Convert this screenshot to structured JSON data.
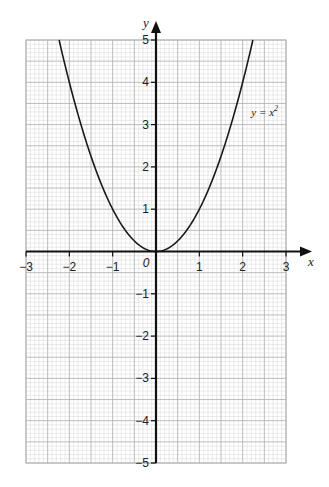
{
  "chart_data": {
    "type": "line",
    "title": "",
    "xlabel": "x",
    "ylabel": "y",
    "xlim": [
      -3,
      3
    ],
    "ylim": [
      -5,
      5
    ],
    "grid": true,
    "grid_minor_step": 0.1,
    "grid_major_step": 0.5,
    "x_ticks": [
      -3,
      -2,
      -1,
      0,
      1,
      2,
      3
    ],
    "x_tick_labels": [
      "−3",
      "−2",
      "−1",
      "0",
      "1",
      "2",
      "3"
    ],
    "y_ticks": [
      -5,
      -4,
      -3,
      -2,
      -1,
      1,
      2,
      3,
      4,
      5
    ],
    "y_tick_labels": [
      "−5",
      "−4",
      "−3",
      "−2",
      "−1",
      "1",
      "2",
      "3",
      "4",
      "5"
    ],
    "origin_label": "0",
    "series": [
      {
        "name": "y = x²",
        "equation": "y = x^2",
        "x": [
          -2.236,
          -2,
          -1.5,
          -1,
          -0.5,
          0,
          0.5,
          1,
          1.5,
          2,
          2.236
        ],
        "y": [
          5,
          4,
          2.25,
          1,
          0.25,
          0,
          0.25,
          1,
          2.25,
          4,
          5
        ]
      }
    ],
    "annotations": [
      {
        "text_main": "y = x",
        "text_sup": "2",
        "x": 2.2,
        "y": 3.2
      }
    ],
    "colors": {
      "curve": "#1a1a1a",
      "axes": "#111111",
      "grid_minor": "#d6d6d6",
      "grid_major": "#b4b4b4"
    }
  }
}
